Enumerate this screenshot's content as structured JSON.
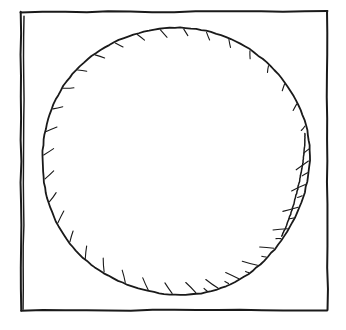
{
  "drawing": {
    "title": "Hand-drawn circle inscribed in a square",
    "medium": "pen-and-ink line sketch",
    "background_color": "#ffffff",
    "ink_color": "#1a1a1a",
    "canvas": {
      "width": 346,
      "height": 330
    }
  },
  "shapes": {
    "square_frame": {
      "name": "square-frame",
      "description": "Outer square border, hand-drawn with slightly wavering edges",
      "left": 21,
      "top": 12,
      "right": 327,
      "bottom": 310,
      "stroke_width": 2.0,
      "doubled_edge": "left",
      "doubled_edge_offset": 3
    },
    "circle": {
      "name": "inscribed-circle",
      "description": "Hand-drawn circle filling the square, slightly irregular",
      "center_x": 175,
      "center_y": 161,
      "radius_x": 134,
      "radius_y": 134,
      "top": 27,
      "bottom": 295,
      "left": 41,
      "right": 309,
      "stroke_width": 1.8
    },
    "inner_arc": {
      "name": "right-inner-arc",
      "description": "Second shorter arc stroke just inside the circle on the right side",
      "start_y": 133,
      "end_y": 236,
      "stroke_width": 1.5
    },
    "hatching": {
      "name": "lower-left-hatching",
      "description": "Short parallel hatch strokes shading the inside of the lower-left arc",
      "start_angle_deg": 152,
      "end_angle_deg": 76,
      "stroke_count": 44,
      "max_length": 16,
      "min_length": 3,
      "stroke_width": 1.1
    }
  }
}
